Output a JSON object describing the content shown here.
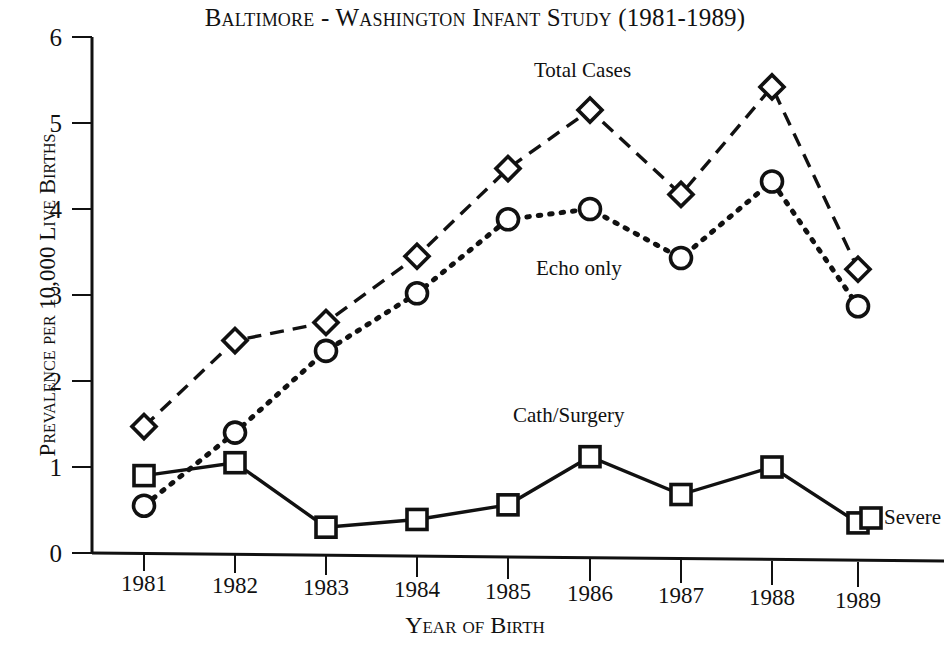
{
  "chart_data": {
    "type": "line",
    "title": "Baltimore - Washington Infant Study (1981-1989)",
    "xlabel": "Year of Birth",
    "ylabel": "Prevalence per 10,000 Live Births",
    "categories": [
      "1981",
      "1982",
      "1983",
      "1984",
      "1985",
      "1986",
      "1987",
      "1988",
      "1989"
    ],
    "x": [
      1981,
      1982,
      1983,
      1984,
      1985,
      1986,
      1987,
      1988,
      1989
    ],
    "ylim": [
      0,
      6
    ],
    "yticks": [
      "0",
      "1",
      "2",
      "3",
      "4",
      "5",
      "6"
    ],
    "ytick_values": [
      0,
      1,
      2,
      3,
      4,
      5,
      6
    ],
    "grid": false,
    "legend": "inline-annotations",
    "series": [
      {
        "name": "Total Cases",
        "marker": "diamond",
        "linestyle": "dashed",
        "color": "#111111",
        "values": [
          1.47,
          2.47,
          2.68,
          3.45,
          4.47,
          5.15,
          4.17,
          5.42,
          3.3
        ]
      },
      {
        "name": "Echo only",
        "marker": "circle",
        "linestyle": "dotted",
        "color": "#111111",
        "values": [
          0.55,
          1.4,
          2.35,
          3.02,
          3.88,
          4.0,
          3.43,
          4.32,
          2.87
        ]
      },
      {
        "name": "Cath/Surgery",
        "marker": "square",
        "linestyle": "solid",
        "color": "#111111",
        "values": [
          0.9,
          1.05,
          0.3,
          0.39,
          0.56,
          1.12,
          0.68,
          1.0,
          0.35
        ]
      }
    ],
    "annotations": [
      {
        "text": "Total Cases",
        "x": 590,
        "y": 58
      },
      {
        "text": "Echo only",
        "x": 536,
        "y": 256
      },
      {
        "text": "Cath/Surgery",
        "x": 586,
        "y": 403
      },
      {
        "text": "Severe",
        "x": 884,
        "y": 505
      }
    ]
  },
  "colors": {
    "ink": "#111111",
    "background": "#ffffff"
  }
}
